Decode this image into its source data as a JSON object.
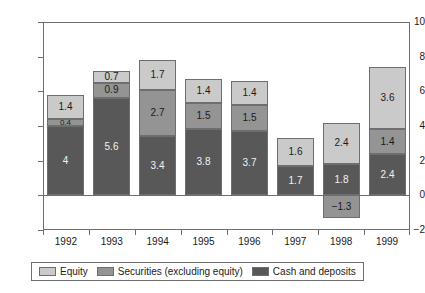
{
  "chart_data": {
    "type": "bar",
    "stacked": true,
    "title": "",
    "subtitle": "",
    "xlabel": "",
    "ylabel": "",
    "categories": [
      "1992",
      "1993",
      "1994",
      "1995",
      "1996",
      "1997",
      "1998",
      "1999"
    ],
    "series": [
      {
        "name": "Cash and deposits",
        "color": "#585858",
        "values": [
          4,
          5.6,
          3.4,
          3.8,
          3.7,
          1.7,
          1.8,
          2.4
        ],
        "labels": [
          "4",
          "5.6",
          "3.4",
          "3.8",
          "3.7",
          "1.7",
          "1.8",
          "2.4"
        ]
      },
      {
        "name": "Securities (excluding equity)",
        "color": "#949494",
        "values": [
          0.4,
          0.9,
          2.7,
          1.5,
          1.5,
          null,
          -1.3,
          1.4
        ],
        "labels": [
          "0.4",
          "0.9",
          "2.7",
          "1.5",
          "1.5",
          "",
          "−1.3",
          "1.4"
        ]
      },
      {
        "name": "Equity",
        "color": "#cacaca",
        "values": [
          1.4,
          0.7,
          1.7,
          1.4,
          1.4,
          1.6,
          2.4,
          3.6
        ],
        "labels": [
          "1.4",
          "0.7",
          "1.7",
          "1.4",
          "1.4",
          "1.6",
          "2.4",
          "3.6"
        ]
      }
    ],
    "ylim": [
      -2,
      10
    ],
    "yticks": [
      10,
      8,
      6,
      4,
      2,
      0,
      -2
    ],
    "ytick_labels": [
      "10",
      "8",
      "6",
      "4",
      "2",
      "0",
      "−2"
    ],
    "grid": false,
    "legend_position": "bottom",
    "legend_order": [
      "Equity",
      "Securities (excluding equity)",
      "Cash and deposits"
    ]
  },
  "legend": {
    "items": [
      {
        "label": "Equity",
        "swatch": "#cacaca"
      },
      {
        "label": "Securities (excluding equity)",
        "swatch": "#949494"
      },
      {
        "label": "Cash and deposits",
        "swatch": "#585858"
      }
    ]
  }
}
